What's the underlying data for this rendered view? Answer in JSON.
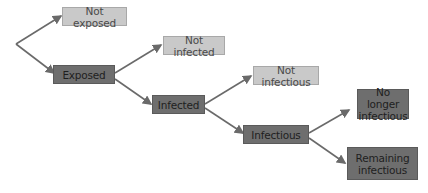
{
  "diagram": {
    "type": "decision-tree",
    "colors": {
      "light_node": "#c9c9c9",
      "dark_node": "#6e6e6e",
      "edge": "#6a6a6a"
    },
    "nodes": {
      "not_exposed": {
        "label": "Not exposed"
      },
      "exposed": {
        "label": "Exposed"
      },
      "not_infected": {
        "label": "Not infected"
      },
      "infected": {
        "label": "Infected"
      },
      "not_infectious": {
        "label": "Not infectious"
      },
      "infectious": {
        "label": "Infectious"
      },
      "no_longer_infectious": {
        "label": "No longer infectious"
      },
      "remaining_infectious": {
        "label": "Remaining infectious"
      }
    },
    "edges": [
      {
        "from": "root",
        "to": "not_exposed"
      },
      {
        "from": "root",
        "to": "exposed"
      },
      {
        "from": "exposed",
        "to": "not_infected"
      },
      {
        "from": "exposed",
        "to": "infected"
      },
      {
        "from": "infected",
        "to": "not_infectious"
      },
      {
        "from": "infected",
        "to": "infectious"
      },
      {
        "from": "infectious",
        "to": "no_longer_infectious"
      },
      {
        "from": "infectious",
        "to": "remaining_infectious"
      }
    ]
  }
}
